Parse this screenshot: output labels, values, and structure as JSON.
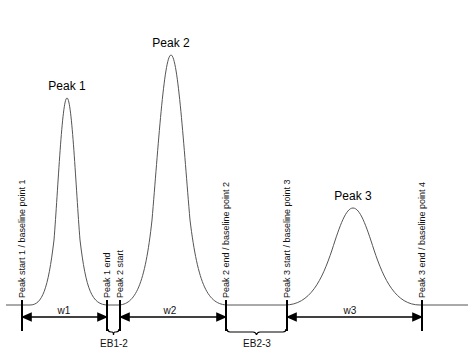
{
  "diagram": {
    "type": "chromatogram-peak-width-diagram",
    "peaks": [
      {
        "label": "Peak 1",
        "apex_x": 67,
        "apex_y": 98
      },
      {
        "label": "Peak 2",
        "apex_x": 171,
        "apex_y": 55
      },
      {
        "label": "Peak 3",
        "apex_x": 353,
        "apex_y": 208
      }
    ],
    "markers": [
      {
        "label": "Peak start 1 / baseline point 1",
        "x": 22
      },
      {
        "label": "Peak 1 end",
        "x": 107
      },
      {
        "label": "Peak 2 start",
        "x": 120
      },
      {
        "label": "Peak 2 end / baseline point 2",
        "x": 226
      },
      {
        "label": "Peak 3 start / baseline point 3",
        "x": 287
      },
      {
        "label": "Peak 3 end  / baseline point 4",
        "x": 422
      }
    ],
    "widths": [
      {
        "label": "w1",
        "from": "Peak start 1",
        "to": "Peak 1 end"
      },
      {
        "label": "w2",
        "from": "Peak 2 start",
        "to": "Peak 2 end"
      },
      {
        "label": "w3",
        "from": "Peak 3 start",
        "to": "Peak 3 end"
      }
    ],
    "brackets": [
      {
        "label": "EB1-2",
        "from": "Peak 1 end",
        "to": "Peak 2 start"
      },
      {
        "label": "EB2-3",
        "from": "Peak 2 end",
        "to": "Peak 3 start"
      }
    ],
    "colors": {
      "curve": "#555555",
      "lines": "#000000",
      "text": "#000000"
    }
  }
}
